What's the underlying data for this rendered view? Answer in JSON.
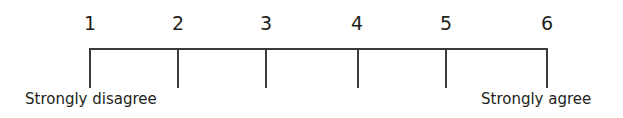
{
  "scale": {
    "points": [
      "1",
      "2",
      "3",
      "4",
      "5",
      "6"
    ],
    "tick_x": [
      90,
      178,
      266,
      358,
      446,
      547
    ],
    "left_anchor": "Strongly disagree",
    "right_anchor": "Strongly agree"
  }
}
